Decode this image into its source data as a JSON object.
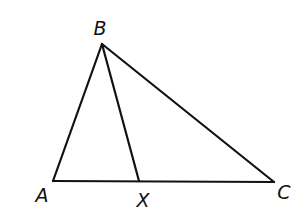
{
  "figure": {
    "type": "triangle-with-cevian",
    "stroke_color": "#111111",
    "background": "#ffffff",
    "vertices": [
      {
        "id": "B",
        "label": "B",
        "x": 102,
        "y": 44,
        "label_x": 100,
        "label_y": 28
      },
      {
        "id": "A",
        "label": "A",
        "x": 53,
        "y": 181,
        "label_x": 42,
        "label_y": 195
      },
      {
        "id": "X",
        "label": "X",
        "x": 139,
        "y": 181,
        "label_x": 143,
        "label_y": 200
      },
      {
        "id": "C",
        "label": "C",
        "x": 274,
        "y": 182,
        "label_x": 284,
        "label_y": 192
      }
    ],
    "segments": [
      {
        "name": "AB",
        "from": "A",
        "to": "B"
      },
      {
        "name": "BC",
        "from": "B",
        "to": "C"
      },
      {
        "name": "AC",
        "from": "A",
        "to": "C"
      },
      {
        "name": "BX",
        "from": "B",
        "to": "X"
      }
    ]
  }
}
